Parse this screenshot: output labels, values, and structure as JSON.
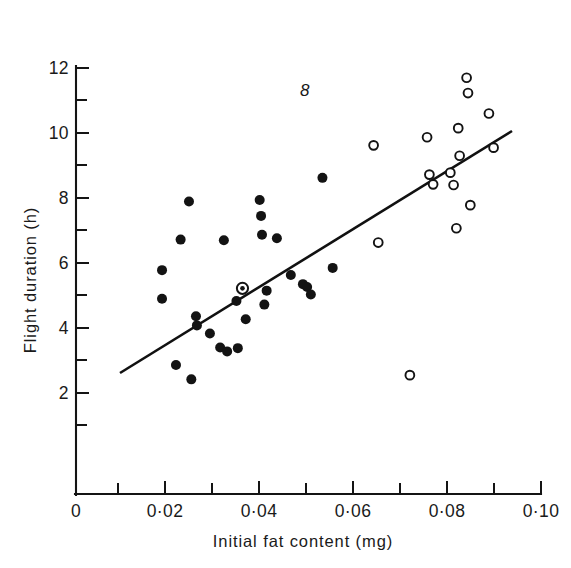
{
  "figure": {
    "number_label": "8",
    "background_color": "#ffffff",
    "ink_color": "#141414"
  },
  "chart_data": {
    "type": "scatter",
    "title": "",
    "subtitle": "",
    "xlabel": "Initial fat content (mg)",
    "ylabel": "Flight duration (h)",
    "xlim": [
      0,
      0.1
    ],
    "ylim": [
      0,
      12
    ],
    "grid": false,
    "legend_position": "none",
    "x_major_ticks": [
      0,
      0.02,
      0.04,
      0.06,
      0.08,
      0.1
    ],
    "x_major_tick_labels": [
      "0",
      "0·02",
      "0·04",
      "0·06",
      "0·08",
      "0·10"
    ],
    "x_minor_ticks": [
      0.01,
      0.03,
      0.05,
      0.07,
      0.09
    ],
    "y_major_ticks": [
      2,
      4,
      6,
      8,
      10,
      12
    ],
    "y_major_tick_labels": [
      "2",
      "4",
      "6",
      "8",
      "10",
      "12"
    ],
    "y_minor_ticks": [
      1,
      3,
      5,
      7,
      9,
      11
    ],
    "series": [
      {
        "name": "filled-circles",
        "marker": "filled-circle",
        "color": "#131313",
        "points": [
          [
            0.0185,
            5.78
          ],
          [
            0.0185,
            4.9
          ],
          [
            0.0215,
            2.86
          ],
          [
            0.0225,
            6.72
          ],
          [
            0.0243,
            7.89
          ],
          [
            0.0248,
            2.42
          ],
          [
            0.0258,
            4.36
          ],
          [
            0.026,
            4.08
          ],
          [
            0.0288,
            3.83
          ],
          [
            0.031,
            3.4
          ],
          [
            0.0318,
            6.7
          ],
          [
            0.0325,
            3.28
          ],
          [
            0.0345,
            4.83
          ],
          [
            0.0348,
            3.38
          ],
          [
            0.0358,
            5.22
          ],
          [
            0.0365,
            4.27
          ],
          [
            0.0395,
            7.94
          ],
          [
            0.0398,
            7.45
          ],
          [
            0.04,
            6.87
          ],
          [
            0.0405,
            4.72
          ],
          [
            0.041,
            5.15
          ],
          [
            0.0432,
            6.76
          ],
          [
            0.0462,
            5.63
          ],
          [
            0.0488,
            5.35
          ],
          [
            0.0497,
            5.26
          ],
          [
            0.0505,
            5.03
          ],
          [
            0.053,
            8.62
          ],
          [
            0.0552,
            5.85
          ]
        ]
      },
      {
        "name": "open-circles",
        "marker": "open-circle",
        "color": "#131313",
        "points": [
          [
            0.064,
            9.62
          ],
          [
            0.065,
            6.63
          ],
          [
            0.0718,
            2.55
          ],
          [
            0.0755,
            9.87
          ],
          [
            0.076,
            8.72
          ],
          [
            0.0768,
            8.42
          ],
          [
            0.0805,
            8.78
          ],
          [
            0.0812,
            8.4
          ],
          [
            0.0818,
            7.07
          ],
          [
            0.0822,
            10.15
          ],
          [
            0.0825,
            9.3
          ],
          [
            0.084,
            11.7
          ],
          [
            0.0843,
            11.23
          ],
          [
            0.0848,
            7.78
          ],
          [
            0.0888,
            10.6
          ],
          [
            0.0898,
            9.55
          ]
        ]
      },
      {
        "name": "centroid",
        "marker": "circle-with-dot",
        "color": "#131313",
        "points": [
          [
            0.0358,
            5.22
          ]
        ]
      }
    ],
    "fit_line": {
      "name": "regression-line",
      "x_start": 0.0104,
      "y_start": 3.36,
      "x_end": 0.0938,
      "y_end": 10.05
    },
    "annotations": [
      {
        "name": "figure-number",
        "text": "8",
        "x": 0.0497,
        "y": 11.28
      }
    ]
  }
}
